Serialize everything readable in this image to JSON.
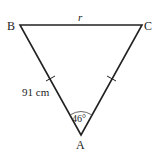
{
  "diagram": {
    "type": "isosceles-triangle",
    "vertices": {
      "A": {
        "label": "A",
        "x": 81,
        "y": 135
      },
      "B": {
        "label": "B",
        "x": 20,
        "y": 25
      },
      "C": {
        "label": "C",
        "x": 142,
        "y": 25
      }
    },
    "side_labels": {
      "BC": "r",
      "AB": "91 cm"
    },
    "angle_label": "46°",
    "equal_side_marks": [
      "AB",
      "AC"
    ],
    "colors": {
      "stroke": "#222222",
      "background": "#ffffff"
    }
  }
}
